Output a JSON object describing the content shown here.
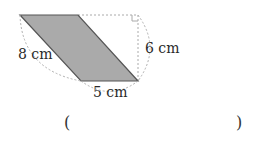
{
  "diagram": {
    "shape": "parallelogram",
    "fill_color": "#aaaaaa",
    "stroke_color": "#555555",
    "dashed_color": "#aaaaaa",
    "labels": {
      "slant_side": "8 cm",
      "height": "6 cm",
      "base": "5 cm"
    }
  },
  "answer": {
    "open_paren": "(",
    "close_paren": ")",
    "value": ""
  }
}
